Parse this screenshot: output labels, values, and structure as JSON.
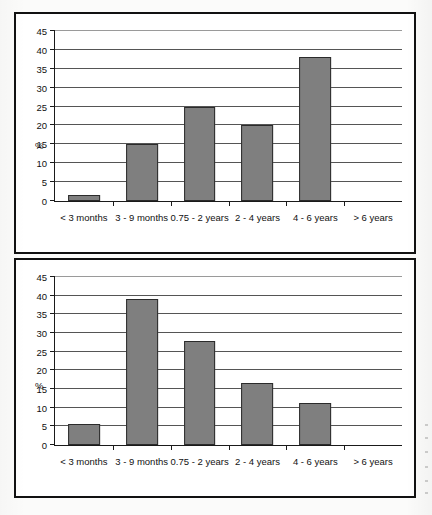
{
  "figure": {
    "background_color": "#fbfbfa",
    "frame_color": "#111111",
    "bar_fill_color": "#7f7f7f",
    "bar_edge_color": "#2b2b2b",
    "gridline_color": "#555555"
  },
  "chart_data": [
    {
      "type": "bar",
      "panel": "top",
      "title": "",
      "xlabel": "",
      "ylabel": "%",
      "ylim": [
        0,
        45
      ],
      "yticks": [
        0,
        5,
        10,
        15,
        20,
        25,
        30,
        35,
        40,
        45
      ],
      "grid": true,
      "legend": "none",
      "categories": [
        "< 3 months",
        "3 - 9 months",
        "0.75 - 2 years",
        "2 - 4 years",
        "4 - 6 years",
        "> 6 years"
      ],
      "values": [
        1.7,
        15,
        25,
        20,
        38,
        0
      ]
    },
    {
      "type": "bar",
      "panel": "bottom",
      "title": "",
      "xlabel": "",
      "ylabel": "%",
      "ylim": [
        0,
        45
      ],
      "yticks": [
        0,
        5,
        10,
        15,
        20,
        25,
        30,
        35,
        40,
        45
      ],
      "grid": true,
      "legend": "none",
      "categories": [
        "< 3 months",
        "3 - 9 months",
        "0.75 - 2 years",
        "2 - 4 years",
        "4 - 6 years",
        "> 6 years"
      ],
      "values": [
        5.5,
        39,
        27.8,
        16.7,
        11.2,
        0
      ]
    }
  ]
}
